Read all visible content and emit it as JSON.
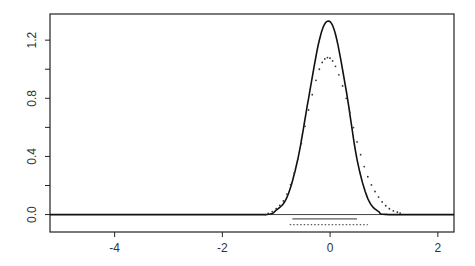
{
  "chart_data": {
    "type": "line",
    "title": "",
    "xlabel": "",
    "ylabel": "",
    "xlim": [
      -5.2,
      2.3
    ],
    "ylim": [
      -0.12,
      1.38
    ],
    "grid": false,
    "legend": null,
    "x_ticks": [
      "-4",
      "-2",
      "0",
      "2"
    ],
    "y_ticks": [
      "0.0",
      "0.4",
      "0.8",
      "1.2"
    ],
    "y_minor_ticks": [
      0.2,
      0.6,
      1.0
    ],
    "series": [
      {
        "name": "solid density",
        "style": "solid",
        "peak_x": -0.05,
        "peak_y": 1.33,
        "x": [
          -5.2,
          -2.0,
          -1.2,
          -1.0,
          -0.8,
          -0.6,
          -0.4,
          -0.2,
          -0.05,
          0.1,
          0.3,
          0.5,
          0.7,
          0.9,
          1.1,
          2.3
        ],
        "y": [
          0.0,
          0.0,
          0.0,
          0.03,
          0.12,
          0.38,
          0.8,
          1.2,
          1.33,
          1.24,
          0.85,
          0.38,
          0.11,
          0.02,
          0.0,
          0.0
        ]
      },
      {
        "name": "dotted density",
        "style": "dotted",
        "peak_x": -0.05,
        "peak_y": 1.08,
        "x": [
          -1.2,
          -1.0,
          -0.8,
          -0.6,
          -0.4,
          -0.2,
          -0.05,
          0.1,
          0.3,
          0.5,
          0.7,
          0.9,
          1.1,
          1.3
        ],
        "y": [
          0.0,
          0.04,
          0.14,
          0.38,
          0.72,
          1.0,
          1.08,
          1.02,
          0.8,
          0.5,
          0.26,
          0.12,
          0.04,
          0.01
        ]
      }
    ],
    "intervals": [
      {
        "name": "solid interval",
        "style": "solid",
        "from": -0.7,
        "to": 0.5,
        "y": -0.03
      },
      {
        "name": "dotted interval",
        "style": "dotted",
        "from": -0.75,
        "to": 0.7,
        "y": -0.07
      }
    ],
    "baseline": 0.0
  }
}
